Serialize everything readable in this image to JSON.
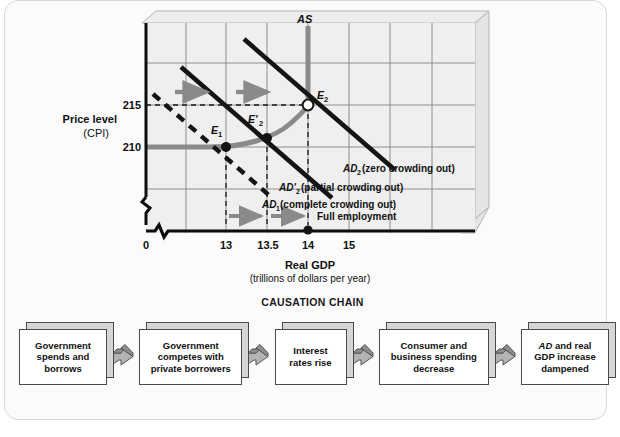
{
  "figure": {
    "background": "#fbfbfb",
    "border_color": "#d8d8d8"
  },
  "chart_data": {
    "type": "line",
    "title": "",
    "xlabel": "Real GDP",
    "xlabel_sub": "(trillions of dollars per year)",
    "ylabel": "Price level",
    "ylabel_sub": "(CPI)",
    "x_ticks": [
      "0",
      "13",
      "13.5",
      "14",
      "15"
    ],
    "y_ticks": [
      "215",
      "210"
    ],
    "xlim_note": "axis broken near origin",
    "ylim_note": "axis broken near origin",
    "grid": true,
    "series": [
      {
        "name": "AS",
        "label": "AS",
        "style": "gray-thick",
        "color": "#8c8c8c",
        "description": "Aggregate supply, horizontal at 210 then rising to vertical at 14"
      },
      {
        "name": "AD1",
        "label": "AD",
        "sub": "1",
        "annotation": "(complete crowding out)",
        "style": "black-dashed",
        "color": "#111111"
      },
      {
        "name": "AD2prime",
        "label": "AD'",
        "sub": "2",
        "annotation": "(partial crowding out)",
        "style": "black-solid",
        "color": "#111111"
      },
      {
        "name": "AD2",
        "label": "AD",
        "sub": "2",
        "annotation": "(zero crowding out)",
        "style": "black-solid",
        "color": "#111111"
      }
    ],
    "points": [
      {
        "id": "E1",
        "label": "E",
        "sub": "1",
        "x": 13,
        "y": 210,
        "fill": "solid"
      },
      {
        "id": "E2prime",
        "label": "E'",
        "sub": "2",
        "x": 13.5,
        "y": 211.5,
        "fill": "solid"
      },
      {
        "id": "E2",
        "label": "E",
        "sub": "2",
        "x": 14,
        "y": 215,
        "fill": "hollow"
      }
    ],
    "annotations": [
      {
        "id": "full-employment",
        "text": "Full employment",
        "x": 14
      },
      {
        "id": "shift-arrow-upper-1",
        "text": "",
        "type": "gray-arrow"
      },
      {
        "id": "shift-arrow-upper-2",
        "text": "",
        "type": "gray-arrow"
      },
      {
        "id": "shift-arrow-lower-1",
        "text": "",
        "type": "gray-arrow"
      },
      {
        "id": "shift-arrow-lower-2",
        "text": "",
        "type": "gray-arrow"
      }
    ],
    "legend_position": "inline"
  },
  "causation": {
    "title": "CAUSATION CHAIN",
    "boxes": [
      {
        "id": "box-1",
        "lines": [
          "Government",
          "spends and",
          "borrows"
        ]
      },
      {
        "id": "box-2",
        "lines": [
          "Government",
          "competes with",
          "private borrowers"
        ]
      },
      {
        "id": "box-3",
        "lines": [
          "Interest",
          "rates rise"
        ]
      },
      {
        "id": "box-4",
        "lines": [
          "Consumer and",
          "business spending",
          "decrease"
        ]
      },
      {
        "id": "box-5",
        "lines": [
          "AD and real",
          "GDP increase",
          "dampened"
        ]
      }
    ],
    "arrow_count": 4
  }
}
